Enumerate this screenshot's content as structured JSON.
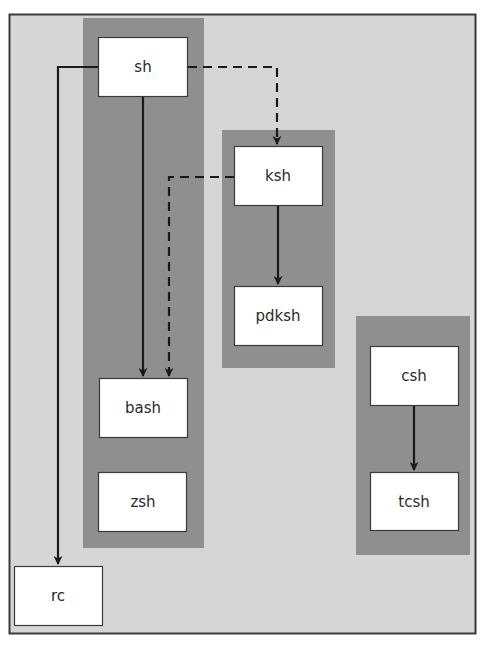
{
  "diagram": {
    "type": "shell-family-tree",
    "colors": {
      "canvas_bg": "#d6d6d6",
      "frame_border": "#3a3a3a",
      "group_bg": "#8f8f8f",
      "node_bg": "#ffffff",
      "node_border": "#3a3a3a",
      "edge": "#1a1a1a",
      "text": "#2a2a2a"
    },
    "groups": [
      {
        "id": "g-bourne",
        "members": [
          "sh",
          "bash",
          "zsh"
        ]
      },
      {
        "id": "g-korn",
        "members": [
          "ksh",
          "pdksh"
        ]
      },
      {
        "id": "g-c",
        "members": [
          "csh",
          "tcsh"
        ]
      }
    ],
    "nodes": {
      "sh": "sh",
      "ksh": "ksh",
      "pdksh": "pdksh",
      "bash": "bash",
      "zsh": "zsh",
      "csh": "csh",
      "tcsh": "tcsh",
      "rc": "rc"
    },
    "edges": [
      {
        "from": "sh",
        "to": "bash",
        "style": "solid"
      },
      {
        "from": "sh",
        "to": "rc",
        "style": "solid"
      },
      {
        "from": "sh",
        "to": "ksh",
        "style": "dashed"
      },
      {
        "from": "ksh",
        "to": "bash",
        "style": "dashed"
      },
      {
        "from": "ksh",
        "to": "pdksh",
        "style": "solid"
      },
      {
        "from": "csh",
        "to": "tcsh",
        "style": "solid"
      }
    ]
  }
}
